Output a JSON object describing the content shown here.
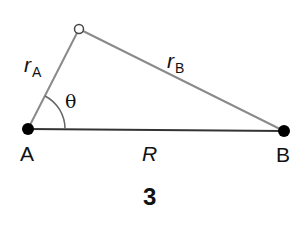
{
  "diagram": {
    "figure_number": "3",
    "points": {
      "A": {
        "label": "A",
        "x": 28,
        "y": 129,
        "style": "filled-dot"
      },
      "B": {
        "label": "B",
        "x": 284,
        "y": 131,
        "style": "filled-dot"
      },
      "P": {
        "label": "",
        "x": 79,
        "y": 29,
        "style": "open-circle"
      }
    },
    "segments": {
      "R": {
        "label": "R",
        "from": "A",
        "to": "B",
        "color": "#222222"
      },
      "rA": {
        "label": "r",
        "subscript": "A",
        "from": "A",
        "to": "P",
        "color": "#888888"
      },
      "rB": {
        "label": "r",
        "subscript": "B",
        "from": "P",
        "to": "B",
        "color": "#888888"
      }
    },
    "angle": {
      "label": "θ",
      "vertex": "A",
      "between": [
        "R",
        "rA"
      ],
      "radius": 37
    }
  }
}
